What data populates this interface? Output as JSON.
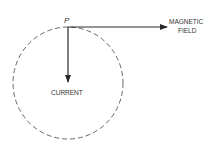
{
  "diagram": {
    "point_label": "P",
    "current_label": "CURRENT",
    "field_label_line1": "MAGNETIC",
    "field_label_line2": "FIELD",
    "colors": {
      "stroke": "#2a2a2a",
      "dashed_circle": "#555555",
      "text": "#333333"
    }
  }
}
